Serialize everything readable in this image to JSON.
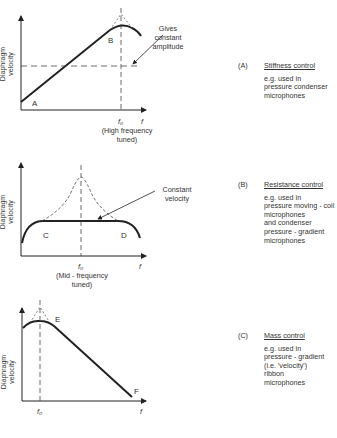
{
  "axes": {
    "ylabel_line1": "Diaphragm",
    "ylabel_line2": "velocity",
    "xlabel": "f",
    "f0": "f₀"
  },
  "graph_a": {
    "point_start": "A",
    "point_peak": "B",
    "annotation_line1": "Gives",
    "annotation_line2": "constant",
    "annotation_line3": "amplitude",
    "caption_line1": "(High  frequency",
    "caption_line2": "tuned)"
  },
  "graph_b": {
    "point_left": "C",
    "point_right": "D",
    "annotation_line1": "Constant",
    "annotation_line2": "velocity",
    "caption_line1": "(Mid - frequency",
    "caption_line2": "tuned)"
  },
  "graph_c": {
    "point_peak": "E",
    "point_end": "F"
  },
  "descriptions": [
    {
      "label": "(A)",
      "title": "Stiffness  control",
      "lines": [
        "e.g.  used  in",
        "pressure  condenser",
        "microphones"
      ]
    },
    {
      "label": "(B)",
      "title": "Resistance  control",
      "lines": [
        "e.g.  used  in",
        "pressure  moving - coil",
        "microphones",
        "and  condenser",
        "pressure - gradient",
        "microphones"
      ]
    },
    {
      "label": "(C)",
      "title": "Mass  control",
      "lines": [
        "e.g.  used  in",
        "pressure - gradient",
        "(i.e.  'velocity')",
        "ribbon",
        "microphones"
      ]
    }
  ]
}
